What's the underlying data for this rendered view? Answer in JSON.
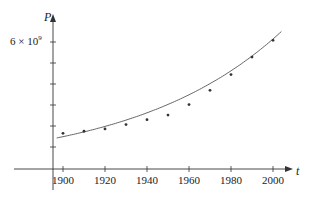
{
  "chart_data": {
    "type": "scatter",
    "title": "",
    "xlabel": "t",
    "ylabel": "P",
    "x_ticks": [
      1900,
      1920,
      1940,
      1960,
      1980,
      2000
    ],
    "x_tick_labels": [
      "1900",
      "1920",
      "1940",
      "1960",
      "1980",
      "2000"
    ],
    "y_ticks": [
      1000000000.0,
      2000000000.0,
      3000000000.0,
      4000000000.0,
      5000000000.0,
      6000000000.0
    ],
    "y_tick_labels": [
      "",
      "",
      "",
      "",
      "",
      "6 × 10⁹"
    ],
    "xlim": [
      1890,
      2010
    ],
    "ylim": [
      0,
      6600000000.0
    ],
    "grid": false,
    "legend": "none",
    "series": [
      {
        "name": "data points",
        "type": "scatter",
        "x": [
          1900,
          1910,
          1920,
          1930,
          1940,
          1950,
          1960,
          1970,
          1980,
          1990,
          2000
        ],
        "y": [
          1650000000.0,
          1750000000.0,
          1860000000.0,
          2070000000.0,
          2300000000.0,
          2520000000.0,
          3020000000.0,
          3700000000.0,
          4450000000.0,
          5280000000.0,
          6080000000.0
        ]
      },
      {
        "name": "exponential fit",
        "type": "line",
        "x": [
          1897,
          1910,
          1920,
          1930,
          1940,
          1950,
          1960,
          1970,
          1980,
          1990,
          2000,
          2004
        ],
        "y": [
          1430000000.0,
          1610000000.0,
          1810000000.0,
          2030000000.0,
          2280000000.0,
          2560000000.0,
          2870000000.0,
          3230000000.0,
          3620000000.0,
          4070000000.0,
          4570000000.0,
          6000000000.0
        ]
      }
    ]
  },
  "labels": {
    "y_axis": "P",
    "x_axis": "t",
    "y_tick_6": "6 × 10",
    "y_tick_6_exp": "9"
  }
}
